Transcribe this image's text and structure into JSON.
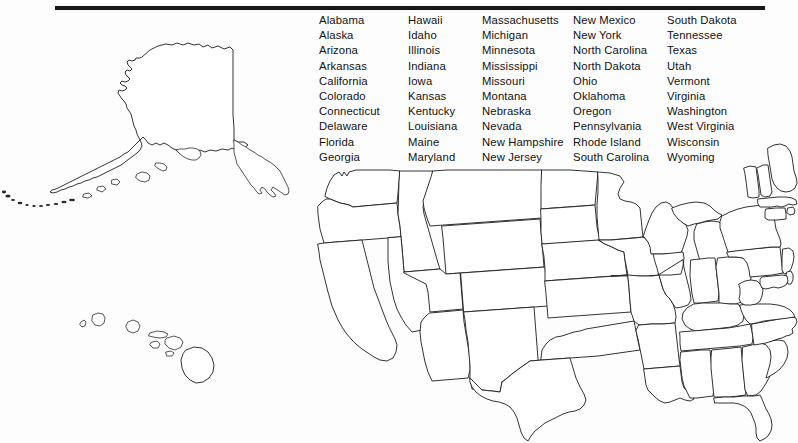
{
  "document": {
    "title": "United States Blank Map Worksheet",
    "background_color": "#fdfdfd",
    "ink_color": "#1d1d1d",
    "rule_color": "#151515"
  },
  "top_rule": {
    "present": true,
    "label": "horizontal-rule"
  },
  "state_list": {
    "heading": "",
    "total": 50,
    "columns": [
      {
        "id": "col-1",
        "states": [
          "Alabama",
          "Alaska",
          "Arizona",
          "Arkansas",
          "California",
          "Colorado",
          "Connecticut",
          "Delaware",
          "Florida",
          "Georgia"
        ]
      },
      {
        "id": "col-2",
        "states": [
          "Hawaii",
          "Idaho",
          "Illinois",
          "Indiana",
          "Iowa",
          "Kansas",
          "Kentucky",
          "Louisiana",
          "Maine",
          "Maryland"
        ]
      },
      {
        "id": "col-3",
        "states": [
          "Massachusetts",
          "Michigan",
          "Minnesota",
          "Mississippi",
          "Missouri",
          "Montana",
          "Nebraska",
          "Nevada",
          "New Hampshire",
          "New Jersey"
        ]
      },
      {
        "id": "col-4",
        "states": [
          "New Mexico",
          "New York",
          "North Carolina",
          "North Dakota",
          "Ohio",
          "Oklahoma",
          "Oregon",
          "Pennsylvania",
          "Rhode Island",
          "South Carolina"
        ]
      },
      {
        "id": "col-5",
        "states": [
          "South Dakota",
          "Tennessee",
          "Texas",
          "Utah",
          "Vermont",
          "Virginia",
          "Washington",
          "West Virginia",
          "Wisconsin",
          "Wyoming"
        ]
      }
    ]
  },
  "map": {
    "label": "united-states-blank-outline-map",
    "insets": [
      {
        "name": "Alaska",
        "position": "upper-left"
      },
      {
        "name": "Hawaii",
        "position": "lower-left"
      }
    ],
    "mainland": {
      "name": "Contiguous United States",
      "position": "right",
      "state_borders_drawn": true,
      "labels_shown": false
    }
  }
}
